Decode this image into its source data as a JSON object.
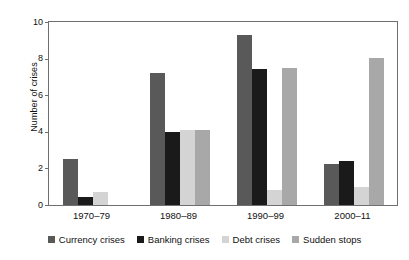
{
  "chart_data": {
    "type": "bar",
    "title": "",
    "subtitle": "",
    "xlabel": "",
    "ylabel": "Number of crises",
    "categories": [
      "1970–79",
      "1980–89",
      "1990–99",
      "2000–11"
    ],
    "series": [
      {
        "name": "Currency crises",
        "color": "#595959",
        "values": [
          2.5,
          7.2,
          9.3,
          2.25
        ]
      },
      {
        "name": "Banking crises",
        "color": "#1a1a1a",
        "values": [
          0.45,
          4.0,
          7.45,
          2.4
        ]
      },
      {
        "name": "Debt crises",
        "color": "#d4d4d4",
        "values": [
          0.7,
          4.1,
          0.8,
          1.0
        ]
      },
      {
        "name": "Sudden stops",
        "color": "#a8a8a8",
        "values": [
          0,
          4.1,
          7.5,
          8.05
        ]
      }
    ],
    "ylim": [
      0,
      10
    ],
    "yticks": [
      0,
      2,
      4,
      6,
      8,
      10
    ],
    "ytick_labels": [
      "0",
      "2",
      "4",
      "6",
      "8",
      "10"
    ],
    "grid": false,
    "legend_position": "bottom",
    "frame": true,
    "frame_color": "#6f6f6f",
    "background_color": "#ffffff"
  },
  "legend": {
    "items": [
      {
        "label": "Currency crises",
        "color": "#595959"
      },
      {
        "label": "Banking crises",
        "color": "#1a1a1a"
      },
      {
        "label": "Debt crises",
        "color": "#d4d4d4"
      },
      {
        "label": "Sudden stops",
        "color": "#a8a8a8"
      }
    ]
  }
}
